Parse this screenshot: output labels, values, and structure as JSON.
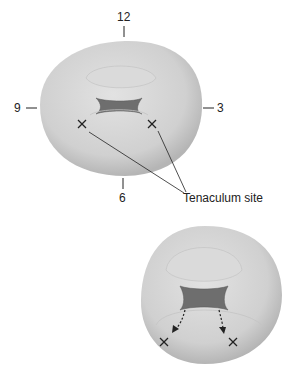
{
  "figure": {
    "top": {
      "clock_labels": {
        "twelve": "12",
        "three": "3",
        "six": "6",
        "nine": "9"
      },
      "annotation": "Tenaculum site"
    },
    "bottom": {}
  },
  "colors": {
    "tissue": "#d4d4d4",
    "tissue_shadow": "#b8b8b8",
    "os": "#6e6e6e",
    "ink": "#222222"
  }
}
